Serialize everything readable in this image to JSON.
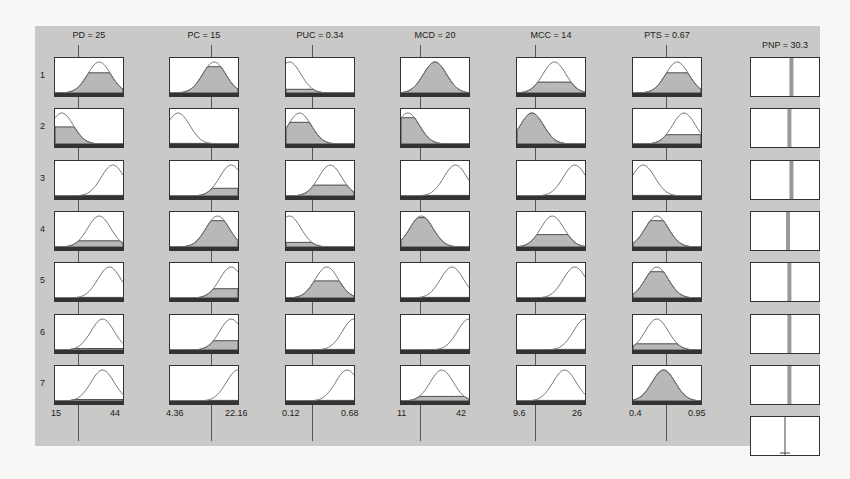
{
  "inputs": [
    {
      "name": "PD",
      "value": "25",
      "label": "PD = 25",
      "min": "15",
      "max": "44",
      "cursor": 0.345
    },
    {
      "name": "PC",
      "value": "15",
      "label": "PC = 15",
      "min": "4.36",
      "max": "22.16",
      "cursor": 0.6
    },
    {
      "name": "PUC",
      "value": "0.34",
      "label": "PUC = 0.34",
      "min": "0.12",
      "max": "0.68",
      "cursor": 0.39
    },
    {
      "name": "MCD",
      "value": "20",
      "label": "MCD = 20",
      "min": "11",
      "max": "42",
      "cursor": 0.29
    },
    {
      "name": "MCC",
      "value": "14",
      "label": "MCC = 14",
      "min": "9.6",
      "max": "26",
      "cursor": 0.27
    },
    {
      "name": "PTS",
      "value": "0.67",
      "label": "PTS = 0.67",
      "min": "0.4",
      "max": "0.95",
      "cursor": 0.49
    }
  ],
  "output": {
    "name": "PNP",
    "value": "30.3",
    "label": "PNP = 30.3"
  },
  "rules": [
    "1",
    "2",
    "3",
    "4",
    "5",
    "6",
    "7"
  ],
  "chart_data": {
    "type": "table",
    "inputs": [
      "PD",
      "PC",
      "PUC",
      "MCD",
      "MCC",
      "PTS"
    ],
    "input_values": [
      25,
      15,
      0.34,
      20,
      14,
      0.67
    ],
    "input_ranges": [
      [
        15,
        44
      ],
      [
        4.36,
        22.16
      ],
      [
        0.12,
        0.68
      ],
      [
        11,
        42
      ],
      [
        9.6,
        26
      ],
      [
        0.4,
        0.95
      ]
    ],
    "output": "PNP",
    "output_value": 30.3,
    "rules": 7,
    "membership": [
      [
        {
          "c": 0.65,
          "f": 0.65
        },
        {
          "c": 0.65,
          "f": 0.85
        },
        {
          "c": 0.05,
          "f": 0.12
        },
        {
          "c": 0.5,
          "f": 1.0
        },
        {
          "c": 0.55,
          "f": 0.35
        },
        {
          "c": 0.65,
          "f": 0.65
        }
      ],
      [
        {
          "c": 0.1,
          "f": 0.55
        },
        {
          "c": 0.12,
          "f": 0.02
        },
        {
          "c": 0.2,
          "f": 0.7
        },
        {
          "c": 0.1,
          "f": 0.85
        },
        {
          "c": 0.22,
          "f": 1.0
        },
        {
          "c": 0.75,
          "f": 0.3
        }
      ],
      [
        {
          "c": 0.85,
          "f": 0.02
        },
        {
          "c": 0.9,
          "f": 0.25
        },
        {
          "c": 0.65,
          "f": 0.35
        },
        {
          "c": 0.8,
          "f": 0.02
        },
        {
          "c": 0.85,
          "f": 0.02
        },
        {
          "c": 0.15,
          "f": 0.02
        }
      ],
      [
        {
          "c": 0.65,
          "f": 0.2
        },
        {
          "c": 0.7,
          "f": 0.85
        },
        {
          "c": 0.05,
          "f": 0.15
        },
        {
          "c": 0.3,
          "f": 0.95
        },
        {
          "c": 0.52,
          "f": 0.4
        },
        {
          "c": 0.35,
          "f": 0.85
        }
      ],
      [
        {
          "c": 0.8,
          "f": 0.02
        },
        {
          "c": 0.9,
          "f": 0.3
        },
        {
          "c": 0.6,
          "f": 0.55
        },
        {
          "c": 0.75,
          "f": 0.02
        },
        {
          "c": 0.85,
          "f": 0.02
        },
        {
          "c": 0.35,
          "f": 0.85
        }
      ],
      [
        {
          "c": 0.7,
          "f": 0.05
        },
        {
          "c": 0.9,
          "f": 0.3
        },
        {
          "c": 1.0,
          "f": 0.02
        },
        {
          "c": 1.0,
          "f": 0.02
        },
        {
          "c": 1.0,
          "f": 0.02
        },
        {
          "c": 0.35,
          "f": 0.2
        }
      ],
      [
        {
          "c": 0.7,
          "f": 0.05
        },
        {
          "c": 1.0,
          "f": 0.02
        },
        {
          "c": 0.9,
          "f": 0.02
        },
        {
          "c": 0.6,
          "f": 0.15
        },
        {
          "c": 0.7,
          "f": 0.02
        },
        {
          "c": 0.45,
          "f": 1.0
        }
      ]
    ],
    "output_bars": [
      0.33,
      0.3,
      0.33,
      0.28,
      0.3,
      0.3,
      0.3
    ],
    "grid": false
  }
}
